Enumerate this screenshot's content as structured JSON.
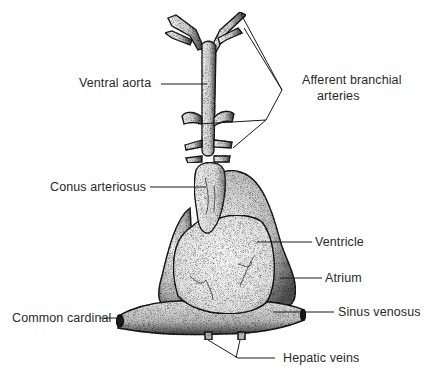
{
  "figure": {
    "labels": {
      "ventral_aorta": "Ventral aorta",
      "afferent_line1": "Afferent branchial",
      "afferent_line2": "arteries",
      "conus_arteriosus": "Conus arteriosus",
      "ventricle": "Ventricle",
      "atrium": "Atrium",
      "common_cardinal": "Common cardinal",
      "sinus_venosus": "Sinus venosus",
      "hepatic_veins": "Hepatic veins"
    },
    "colors": {
      "ink": "#1a1a1a",
      "stipple_dark": "#555555",
      "stipple_light": "#dddddd",
      "background": "#ffffff"
    }
  }
}
